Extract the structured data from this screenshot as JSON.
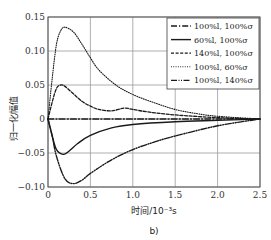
{
  "chart_data": {
    "type": "line",
    "title": "",
    "panel_label": "b)",
    "xlabel": "时间/10⁻³s",
    "ylabel": "归一化幅值",
    "xlim": [
      0,
      2.5
    ],
    "ylim": [
      -0.1,
      0.15
    ],
    "xticks": [
      "0",
      "0.5",
      "1.0",
      "1.5",
      "2.0",
      "2.5"
    ],
    "yticks": [
      "0.15",
      "0.10",
      "0.05",
      "0",
      "−0.05",
      "−0.10"
    ],
    "grid": true,
    "legend_position": "upper right",
    "series": [
      {
        "name": "100%l, 100%σ",
        "style": "dash-dot",
        "x": [
          0,
          0.5,
          1.0,
          1.5,
          2.0,
          2.5
        ],
        "y": [
          0,
          0,
          0,
          0,
          0,
          0
        ]
      },
      {
        "name": "60%l, 100%σ",
        "style": "solid",
        "x": [
          0,
          0.05,
          0.1,
          0.18,
          0.25,
          0.35,
          0.5,
          0.75,
          1.0,
          1.5,
          2.0,
          2.5
        ],
        "y": [
          0,
          -0.025,
          -0.045,
          -0.052,
          -0.047,
          -0.036,
          -0.024,
          -0.013,
          -0.008,
          -0.004,
          -0.002,
          0
        ]
      },
      {
        "name": "140%l, 100%σ",
        "style": "dashed",
        "x": [
          0,
          0.05,
          0.1,
          0.15,
          0.2,
          0.3,
          0.4,
          0.5,
          0.6,
          0.75,
          0.9,
          1.0,
          1.2,
          1.5,
          2.0,
          2.5
        ],
        "y": [
          0,
          0.025,
          0.045,
          0.05,
          0.048,
          0.037,
          0.026,
          0.019,
          0.014,
          0.012,
          0.016,
          0.014,
          0.01,
          0.006,
          0.002,
          0
        ]
      },
      {
        "name": "100%l, 60%σ",
        "style": "dotted",
        "x": [
          0,
          0.05,
          0.1,
          0.15,
          0.2,
          0.3,
          0.4,
          0.5,
          0.6,
          0.8,
          1.0,
          1.25,
          1.5,
          1.75,
          2.0,
          2.5
        ],
        "y": [
          0,
          0.06,
          0.11,
          0.13,
          0.135,
          0.128,
          0.11,
          0.09,
          0.072,
          0.05,
          0.036,
          0.024,
          0.014,
          0.008,
          0.004,
          0
        ]
      },
      {
        "name": "100%l, 140%σ",
        "style": "dash-dot-dot",
        "x": [
          0,
          0.05,
          0.1,
          0.2,
          0.3,
          0.4,
          0.5,
          0.75,
          1.0,
          1.25,
          1.5,
          2.0,
          2.5
        ],
        "y": [
          0,
          -0.025,
          -0.055,
          -0.088,
          -0.095,
          -0.09,
          -0.08,
          -0.06,
          -0.045,
          -0.034,
          -0.025,
          -0.01,
          0
        ]
      }
    ]
  }
}
